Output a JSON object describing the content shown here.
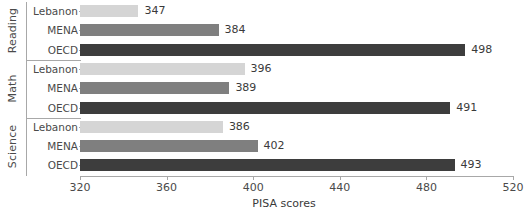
{
  "chart_data": {
    "type": "bar",
    "orientation": "horizontal",
    "title": "",
    "xlabel": "PISA scores",
    "ylabel": "",
    "xlim": [
      320,
      520
    ],
    "xticks": [
      320,
      360,
      400,
      440,
      480,
      520
    ],
    "grid": false,
    "legend": "none",
    "categories": [
      "Lebanon",
      "MENA",
      "OECD"
    ],
    "groups": [
      {
        "name": "Reading",
        "bars": [
          {
            "category": "Lebanon",
            "value": 347,
            "color": "#d5d5d5"
          },
          {
            "category": "MENA",
            "value": 384,
            "color": "#7f7f7f"
          },
          {
            "category": "OECD",
            "value": 498,
            "color": "#3d3d3d"
          }
        ]
      },
      {
        "name": "Math",
        "bars": [
          {
            "category": "Lebanon",
            "value": 396,
            "color": "#d5d5d5"
          },
          {
            "category": "MENA",
            "value": 389,
            "color": "#7f7f7f"
          },
          {
            "category": "OECD",
            "value": 491,
            "color": "#3d3d3d"
          }
        ]
      },
      {
        "name": "Science",
        "bars": [
          {
            "category": "Lebanon",
            "value": 386,
            "color": "#d5d5d5"
          },
          {
            "category": "MENA",
            "value": 402,
            "color": "#7f7f7f"
          },
          {
            "category": "OECD",
            "value": 493,
            "color": "#3d3d3d"
          }
        ]
      }
    ]
  },
  "axis": {
    "tick_labels": [
      "320",
      "360",
      "400",
      "440",
      "480",
      "520"
    ],
    "title": "PISA scores"
  },
  "groups_meta": [
    {
      "label": "Reading"
    },
    {
      "label": "Math"
    },
    {
      "label": "Science"
    }
  ],
  "values_text": {
    "reading": {
      "lebanon": "347",
      "mena": "384",
      "oecd": "498"
    },
    "math": {
      "lebanon": "396",
      "mena": "389",
      "oecd": "491"
    },
    "science": {
      "lebanon": "386",
      "mena": "402",
      "oecd": "493"
    }
  }
}
